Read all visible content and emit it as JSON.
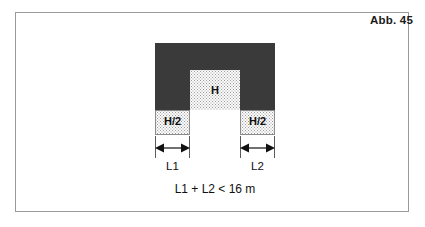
{
  "figure": {
    "caption": "Abb. 45",
    "formula": "L1 + L2 < 16 m",
    "colors": {
      "mass_fill": "#3a3a3a",
      "zone_fill": "#fbfbfb",
      "stipple_dot": "#9c9c9c",
      "frame_border": "#9a9a9a",
      "text": "#111111",
      "background": "#ffffff"
    },
    "zones": {
      "height_full": "H",
      "height_half_left": "H/2",
      "height_half_right": "H/2"
    },
    "dimensions": {
      "left": "L1",
      "right": "L2"
    }
  }
}
